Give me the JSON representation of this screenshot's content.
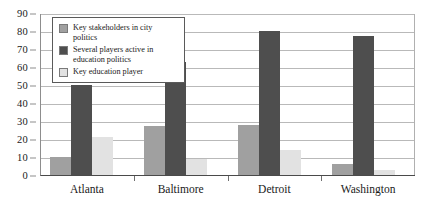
{
  "chart_data": {
    "type": "bar",
    "title": "",
    "subtitle": "",
    "xlabel": "",
    "ylabel": "",
    "categories": [
      "Atlanta",
      "Baltimore",
      "Detroit",
      "Washington"
    ],
    "series": [
      {
        "name": "Key stakeholders in city politics",
        "color": "#a0a0a0",
        "values": [
          10,
          27,
          28,
          6
        ]
      },
      {
        "name": "Several players active in education politics",
        "color": "#4e4e4e",
        "values": [
          50,
          63,
          80,
          77
        ]
      },
      {
        "name": "Key education player",
        "color": "#e2e2e2",
        "values": [
          21,
          9,
          14,
          3
        ]
      }
    ],
    "ylim": [
      0,
      90
    ],
    "ytick_values": [
      0,
      10,
      20,
      30,
      40,
      50,
      60,
      70,
      80,
      90
    ],
    "ytick_labels": [
      "0",
      "10",
      "20",
      "30",
      "40",
      "50",
      "60",
      "70",
      "80",
      "90"
    ],
    "grid": true,
    "grid_axis": "y",
    "legend_position": "upper-left-inside",
    "annotations": []
  },
  "legend": {
    "entries": [
      {
        "label": "Key stakeholders in city politics"
      },
      {
        "label": "Several players active in education politics"
      },
      {
        "label": "Key education player"
      }
    ]
  }
}
